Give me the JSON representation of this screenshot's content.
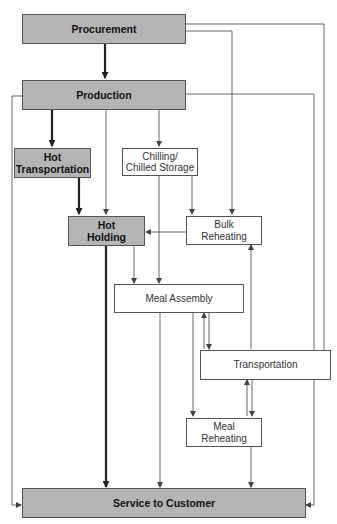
{
  "diagram": {
    "nodes": {
      "procurement": {
        "label": "Procurement",
        "style": "shaded"
      },
      "production": {
        "label": "Production",
        "style": "shaded"
      },
      "hot_transportation": {
        "label": "Hot Transportation",
        "line1": "Hot",
        "line2": "Transportation",
        "style": "shaded"
      },
      "chilling": {
        "label": "Chilling/ Chilled Storage",
        "line1": "Chilling/",
        "line2": "Chilled Storage",
        "style": "plain"
      },
      "hot_holding": {
        "label": "Hot Holding",
        "line1": "Hot",
        "line2": "Holding",
        "style": "shaded"
      },
      "bulk_reheating": {
        "label": "Bulk Reheating",
        "line1": "Bulk",
        "line2": "Reheating",
        "style": "plain"
      },
      "meal_assembly": {
        "label": "Meal Assembly",
        "style": "plain"
      },
      "transportation": {
        "label": "Transportation",
        "style": "plain"
      },
      "meal_reheating": {
        "label": "Meal Reheating",
        "line1": "Meal",
        "line2": "Reheating",
        "style": "plain"
      },
      "service": {
        "label": "Service to Customer",
        "style": "shaded"
      }
    },
    "edges": [
      {
        "from": "Procurement",
        "to": "Production",
        "weight": "thick"
      },
      {
        "from": "Procurement",
        "to": "Bulk Reheating",
        "weight": "thin"
      },
      {
        "from": "Procurement",
        "to": "Transportation",
        "weight": "thin"
      },
      {
        "from": "Production",
        "to": "Hot Transportation",
        "weight": "thick"
      },
      {
        "from": "Production",
        "to": "Hot Holding",
        "weight": "thin"
      },
      {
        "from": "Production",
        "to": "Chilling/Chilled Storage",
        "weight": "thin"
      },
      {
        "from": "Production",
        "to": "Transportation",
        "weight": "thin"
      },
      {
        "from": "Production",
        "to": "Service to Customer",
        "weight": "thin"
      },
      {
        "from": "Hot Transportation",
        "to": "Hot Holding",
        "weight": "thick"
      },
      {
        "from": "Chilling/Chilled Storage",
        "to": "Bulk Reheating",
        "weight": "thin"
      },
      {
        "from": "Chilling/Chilled Storage",
        "to": "Meal Assembly",
        "weight": "thin"
      },
      {
        "from": "Bulk Reheating",
        "to": "Hot Holding",
        "weight": "thin"
      },
      {
        "from": "Hot Holding",
        "to": "Meal Assembly",
        "weight": "thin"
      },
      {
        "from": "Hot Holding",
        "to": "Service to Customer",
        "weight": "thick"
      },
      {
        "from": "Meal Assembly",
        "to": "Transportation",
        "weight": "thin",
        "bidirectional": true
      },
      {
        "from": "Meal Assembly",
        "to": "Meal Reheating",
        "weight": "thin"
      },
      {
        "from": "Meal Assembly",
        "to": "Service to Customer",
        "weight": "thin"
      },
      {
        "from": "Transportation",
        "to": "Bulk Reheating",
        "weight": "thin"
      },
      {
        "from": "Transportation",
        "to": "Meal Reheating",
        "weight": "thin",
        "bidirectional": true
      },
      {
        "from": "Transportation",
        "to": "Service to Customer",
        "weight": "thin"
      },
      {
        "from": "Meal Reheating",
        "to": "Service to Customer",
        "weight": "thin"
      }
    ]
  }
}
